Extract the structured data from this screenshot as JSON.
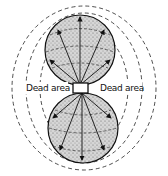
{
  "diagram": {
    "labels": {
      "left_dead_area": "Dead area",
      "right_dead_area": "Dead area"
    },
    "colors": {
      "lobe_fill": "#c8c8c8",
      "line": "#111111"
    }
  }
}
